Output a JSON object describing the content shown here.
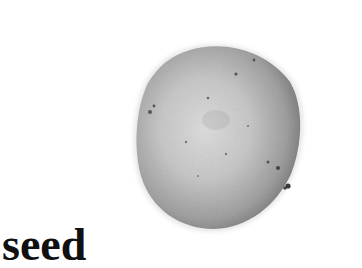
{
  "label": {
    "text": "seed"
  },
  "image": {
    "subject": "seed",
    "colors": {
      "background": "#ffffff",
      "seed_light": "#d8d8d8",
      "seed_mid": "#a8a8a8",
      "seed_dark": "#5a5a5a",
      "text": "#111111"
    }
  }
}
